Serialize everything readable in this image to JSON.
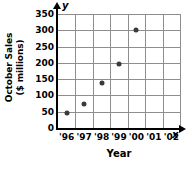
{
  "chart_data": {
    "type": "scatter",
    "title": "",
    "xlabel": "Year",
    "ylabel": "October Sales\n($ millions)",
    "ylabel_line1": "October Sales",
    "ylabel_line2": "($ millions)",
    "x_axis_name": "x",
    "y_axis_name": "y",
    "categories": [
      "'96",
      "'97",
      "'98",
      "'99",
      "'00",
      "'01",
      "'02"
    ],
    "x_tick_labels": [
      "'96",
      "'97",
      "'98",
      "'99",
      "'00",
      "'01",
      "'02"
    ],
    "y_tick_labels": [
      "0",
      "50",
      "100",
      "150",
      "200",
      "250",
      "300",
      "350"
    ],
    "y_ticks": [
      0,
      50,
      100,
      150,
      200,
      250,
      300,
      350
    ],
    "ylim": [
      0,
      350
    ],
    "xlim": [
      0,
      7
    ],
    "grid": true,
    "legend": "none",
    "point_color": "#3a3a3a",
    "grid_color": "#8e8e8e",
    "axis_color": "#000000",
    "points": [
      {
        "x_label": "'96",
        "x_index": 1,
        "y": 45
      },
      {
        "x_label": "'97",
        "x_index": 2,
        "y": 73
      },
      {
        "x_label": "'98",
        "x_index": 3,
        "y": 137
      },
      {
        "x_label": "'99",
        "x_index": 4,
        "y": 197
      },
      {
        "x_label": "'00",
        "x_index": 5,
        "y": 300
      }
    ],
    "values": [
      45,
      73,
      137,
      197,
      300,
      null,
      null
    ]
  }
}
